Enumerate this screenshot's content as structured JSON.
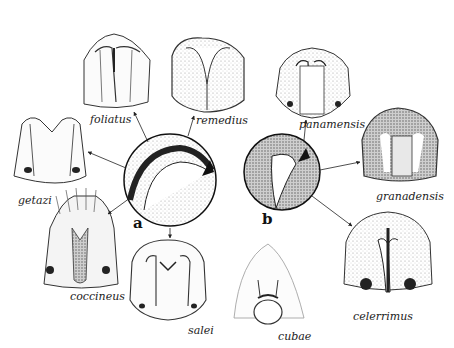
{
  "figure": {
    "type": "comparative morphology illustration",
    "panels": [
      {
        "id": "a",
        "label": "a",
        "description": "magnified detail (circle) with arrow"
      },
      {
        "id": "b",
        "label": "b",
        "description": "magnified detail (circle) with arrow"
      }
    ],
    "specimens": [
      {
        "name": "foliatus",
        "group": "a"
      },
      {
        "name": "remedius",
        "group": "a"
      },
      {
        "name": "getazi",
        "group": "a"
      },
      {
        "name": "coccineus",
        "group": "a"
      },
      {
        "name": "salei",
        "group": "a"
      },
      {
        "name": "panamensis",
        "group": "b"
      },
      {
        "name": "granadensis",
        "group": "b"
      },
      {
        "name": "celerrimus",
        "group": "b"
      },
      {
        "name": "cubae",
        "group": "none"
      }
    ],
    "labels": {
      "foliatus": "foliatus",
      "remedius": "remedius",
      "getazi": "getazi",
      "coccineus": "coccineus",
      "salei": "salei",
      "panamensis": "panamensis",
      "granadensis": "granadensis",
      "celerrimus": "celerrimus",
      "cubae": "cubae",
      "panel_a": "a",
      "panel_b": "b"
    },
    "colors": {
      "ink": "#1a1a1a",
      "shade": "#6b6b6b",
      "paper": "#ffffff"
    }
  }
}
